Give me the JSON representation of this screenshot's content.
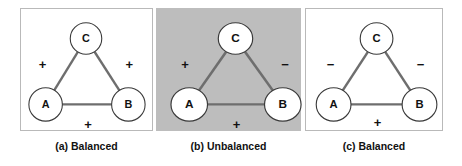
{
  "figure": {
    "background_color": "#ffffff",
    "panel_border_color": "#b9b9b9",
    "shaded_panel_color": "#bdbdbd",
    "edge_color": "#6e6e6e",
    "node_fill": "#ffffff",
    "node_stroke": "#3a3a3a",
    "text_color": "#111111"
  },
  "panels": [
    {
      "id": "a",
      "caption": "(a) Balanced",
      "shaded": false,
      "nodes": [
        {
          "id": "C",
          "label": "C",
          "cx": 66,
          "cy": 30,
          "r": 16
        },
        {
          "id": "A",
          "label": "A",
          "cx": 25,
          "cy": 97,
          "r": 17
        },
        {
          "id": "B",
          "label": "B",
          "cx": 109,
          "cy": 97,
          "r": 17
        }
      ],
      "edges": [
        {
          "source": "A",
          "target": "C",
          "sign": "+",
          "sign_x": 22,
          "sign_y": 55
        },
        {
          "source": "C",
          "target": "B",
          "sign": "+",
          "sign_x": 110,
          "sign_y": 55
        },
        {
          "source": "A",
          "target": "B",
          "sign": "+",
          "sign_x": 68,
          "sign_y": 115
        }
      ]
    },
    {
      "id": "b",
      "caption": "(b) Unbalanced",
      "shaded": true,
      "nodes": [
        {
          "id": "C",
          "label": "C",
          "cx": 73,
          "cy": 30,
          "r": 16
        },
        {
          "id": "A",
          "label": "A",
          "cx": 30,
          "cy": 97,
          "r": 17
        },
        {
          "id": "B",
          "label": "B",
          "cx": 117,
          "cy": 97,
          "r": 17
        }
      ],
      "edges": [
        {
          "source": "A",
          "target": "C",
          "sign": "+",
          "sign_x": 26,
          "sign_y": 55
        },
        {
          "source": "C",
          "target": "B",
          "sign": "−",
          "sign_x": 119,
          "sign_y": 55
        },
        {
          "source": "A",
          "target": "B",
          "sign": "+",
          "sign_x": 74,
          "sign_y": 115
        }
      ]
    },
    {
      "id": "c",
      "caption": "(c) Balanced",
      "shaded": false,
      "nodes": [
        {
          "id": "C",
          "label": "C",
          "cx": 69,
          "cy": 30,
          "r": 16
        },
        {
          "id": "A",
          "label": "A",
          "cx": 27,
          "cy": 97,
          "r": 17
        },
        {
          "id": "B",
          "label": "B",
          "cx": 111,
          "cy": 97,
          "r": 17
        }
      ],
      "edges": [
        {
          "source": "A",
          "target": "C",
          "sign": "−",
          "sign_x": 24,
          "sign_y": 55
        },
        {
          "source": "C",
          "target": "B",
          "sign": "−",
          "sign_x": 112,
          "sign_y": 55
        },
        {
          "source": "A",
          "target": "B",
          "sign": "+",
          "sign_x": 70,
          "sign_y": 113
        }
      ]
    }
  ],
  "chart_data": {
    "type": "diagram",
    "legend": [],
    "triads": [
      {
        "panel": "a",
        "label": "(a) Balanced",
        "balanced": true,
        "shaded": false,
        "nodes": [
          "A",
          "B",
          "C"
        ],
        "edges": [
          {
            "pair": [
              "A",
              "C"
            ],
            "sign": "+"
          },
          {
            "pair": [
              "C",
              "B"
            ],
            "sign": "+"
          },
          {
            "pair": [
              "A",
              "B"
            ],
            "sign": "+"
          }
        ],
        "product_of_signs": "+"
      },
      {
        "panel": "b",
        "label": "(b) Unbalanced",
        "balanced": false,
        "shaded": true,
        "nodes": [
          "A",
          "B",
          "C"
        ],
        "edges": [
          {
            "pair": [
              "A",
              "C"
            ],
            "sign": "+"
          },
          {
            "pair": [
              "C",
              "B"
            ],
            "sign": "−"
          },
          {
            "pair": [
              "A",
              "B"
            ],
            "sign": "+"
          }
        ],
        "product_of_signs": "−"
      },
      {
        "panel": "c",
        "label": "(c) Balanced",
        "balanced": true,
        "shaded": false,
        "nodes": [
          "A",
          "B",
          "C"
        ],
        "edges": [
          {
            "pair": [
              "A",
              "C"
            ],
            "sign": "−"
          },
          {
            "pair": [
              "C",
              "B"
            ],
            "sign": "−"
          },
          {
            "pair": [
              "A",
              "B"
            ],
            "sign": "+"
          }
        ],
        "product_of_signs": "+"
      }
    ]
  }
}
